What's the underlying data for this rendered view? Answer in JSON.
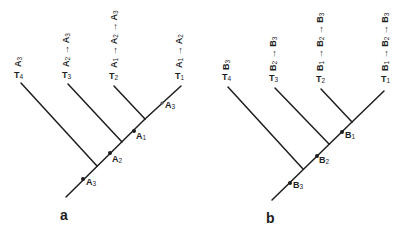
{
  "panels": [
    {
      "id": "a",
      "label": "a",
      "taxa": [
        {
          "name": "T4",
          "letter": "T",
          "sub": "4",
          "trait": [
            [
              "A",
              "3"
            ]
          ]
        },
        {
          "name": "T3",
          "letter": "T",
          "sub": "3",
          "trait": [
            [
              "A",
              "2"
            ],
            [
              "A",
              "3"
            ]
          ]
        },
        {
          "name": "T2",
          "letter": "T",
          "sub": "2",
          "trait": [
            [
              "A",
              "1"
            ],
            [
              "A",
              "2"
            ],
            [
              "A",
              "3"
            ]
          ]
        },
        {
          "name": "T1",
          "letter": "T",
          "sub": "1",
          "trait": [
            [
              "A",
              "1"
            ],
            [
              "A",
              "2"
            ]
          ]
        }
      ],
      "markers": [
        {
          "letter": "A",
          "sub": "3",
          "position": "trunk-lower"
        },
        {
          "letter": "A",
          "sub": "2",
          "position": "trunk-middle"
        },
        {
          "letter": "A",
          "sub": "1",
          "position": "trunk-upper"
        },
        {
          "letter": "A",
          "sub": "3",
          "position": "T1-branch",
          "style": "reversal"
        }
      ]
    },
    {
      "id": "b",
      "label": "b",
      "taxa": [
        {
          "name": "T4",
          "letter": "T",
          "sub": "4",
          "trait": [
            [
              "B",
              "3"
            ]
          ]
        },
        {
          "name": "T3",
          "letter": "T",
          "sub": "3",
          "trait": [
            [
              "B",
              "2"
            ],
            [
              "B",
              "3"
            ]
          ]
        },
        {
          "name": "T2",
          "letter": "T",
          "sub": "2",
          "trait": [
            [
              "B",
              "1"
            ],
            [
              "B",
              "2"
            ],
            [
              "B",
              "3"
            ]
          ]
        },
        {
          "name": "T1",
          "letter": "T",
          "sub": "1",
          "trait": [
            [
              "B",
              "1"
            ],
            [
              "B",
              "2"
            ],
            [
              "B",
              "3"
            ]
          ]
        }
      ],
      "markers": [
        {
          "letter": "B",
          "sub": "3",
          "position": "trunk-lower"
        },
        {
          "letter": "B",
          "sub": "2",
          "position": "trunk-middle"
        },
        {
          "letter": "B",
          "sub": "1",
          "position": "trunk-upper"
        }
      ]
    }
  ],
  "arrow_symbol": "→"
}
